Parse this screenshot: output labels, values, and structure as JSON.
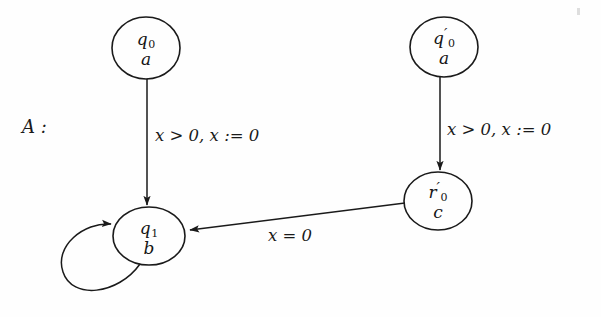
{
  "figure": {
    "kind": "timed-automaton-diagram",
    "name_label": "A :",
    "background_color": "#fefefe",
    "stroke_color": "#1a1a1a",
    "width": 601,
    "height": 317
  },
  "states": [
    {
      "id": "q0",
      "location_name": "q",
      "location_sub": "0",
      "location_prime": "",
      "invariant_label": "a",
      "cx": 146,
      "cy": 48,
      "rx": 34,
      "ry": 31
    },
    {
      "id": "q0prime",
      "location_name": "q",
      "location_sub": "0",
      "location_prime": "′",
      "invariant_label": "a",
      "cx": 444,
      "cy": 47,
      "rx": 34,
      "ry": 30
    },
    {
      "id": "q1",
      "location_name": "q",
      "location_sub": "1",
      "location_prime": "",
      "invariant_label": "b",
      "cx": 149,
      "cy": 236,
      "rx": 36,
      "ry": 29
    },
    {
      "id": "r0prime",
      "location_name": "r",
      "location_sub": "0",
      "location_prime": "′",
      "invariant_label": "c",
      "cx": 438,
      "cy": 201,
      "rx": 34,
      "ry": 29
    }
  ],
  "transitions": [
    {
      "id": "q0-to-q1",
      "from": "q0",
      "to": "q1",
      "label": "x > 0, x := 0",
      "guard": "x > 0",
      "reset": "x := 0",
      "label_x": 155,
      "label_y": 126
    },
    {
      "id": "q0prime-to-r0prime",
      "from": "q0prime",
      "to": "r0prime",
      "label": "x > 0, x := 0",
      "guard": "x > 0",
      "reset": "x := 0",
      "label_x": 447,
      "label_y": 120
    },
    {
      "id": "r0prime-to-q1",
      "from": "r0prime",
      "to": "q1",
      "label": "x = 0",
      "guard": "x = 0",
      "reset": "",
      "label_x": 268,
      "label_y": 226
    },
    {
      "id": "q1-self-loop",
      "from": "q1",
      "to": "q1",
      "label": "",
      "guard": "",
      "reset": "",
      "label_x": 0,
      "label_y": 0
    }
  ]
}
